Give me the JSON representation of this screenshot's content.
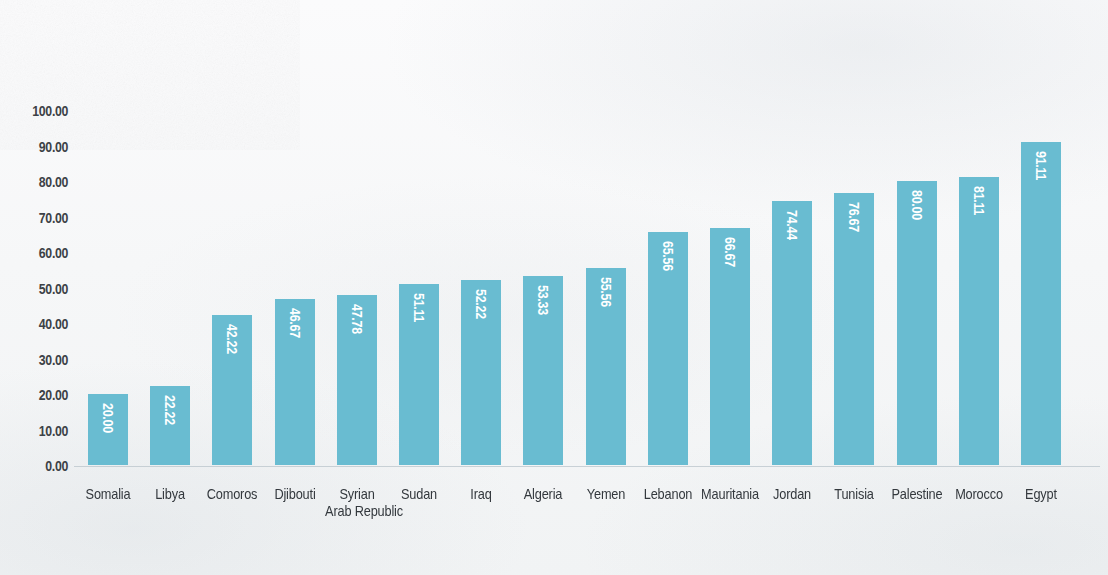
{
  "chart_data": {
    "type": "bar",
    "title": "",
    "subtitle": "",
    "xlabel": "",
    "ylabel": "",
    "ylim": [
      0,
      100
    ],
    "ytick_labels": [
      "100.00",
      "90.00",
      "80.00",
      "70.00",
      "60.00",
      "50.00",
      "40.00",
      "30.00",
      "20.00",
      "10.00",
      "0.00"
    ],
    "ytick_values": [
      100,
      90,
      80,
      70,
      60,
      50,
      40,
      30,
      20,
      10,
      0
    ],
    "grid": false,
    "legend": false,
    "orientation": "vertical",
    "bar_color": "#69bcd1",
    "value_label_color": "#ffffff",
    "value_label_rotation": 90,
    "categories": [
      "Somalia",
      "Libya",
      "Comoros",
      "Djibouti",
      "Syrian Arab Republic",
      "Sudan",
      "Iraq",
      "Algeria",
      "Yemen",
      "Lebanon",
      "Mauritania",
      "Jordan",
      "Tunisia",
      "Palestine",
      "Morocco",
      "Egypt"
    ],
    "category_lines": [
      [
        "Somalia"
      ],
      [
        "Libya"
      ],
      [
        "Comoros"
      ],
      [
        "Djibouti"
      ],
      [
        "Syrian",
        "Arab Republic"
      ],
      [
        "Sudan"
      ],
      [
        "Iraq"
      ],
      [
        "Algeria"
      ],
      [
        "Yemen"
      ],
      [
        "Lebanon"
      ],
      [
        "Mauritania"
      ],
      [
        "Jordan"
      ],
      [
        "Tunisia"
      ],
      [
        "Palestine"
      ],
      [
        "Morocco"
      ],
      [
        "Egypt"
      ]
    ],
    "values": [
      20.0,
      22.22,
      42.22,
      46.67,
      47.78,
      51.11,
      52.22,
      53.33,
      55.56,
      65.56,
      66.67,
      74.44,
      76.67,
      80.0,
      81.11,
      91.11
    ],
    "value_labels": [
      "20.00",
      "22.22",
      "42.22",
      "46.67",
      "47.78",
      "51.11",
      "52.22",
      "53.33",
      "55.56",
      "65.56",
      "66.67",
      "74.44",
      "76.67",
      "80.00",
      "81.11",
      "91.11"
    ]
  }
}
